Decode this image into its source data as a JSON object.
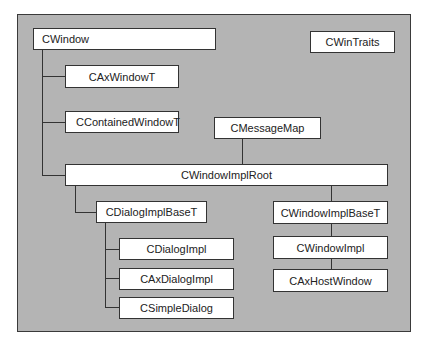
{
  "diagram": {
    "nodes": {
      "cwindow": "CWindow",
      "cwintraits": "CWinTraits",
      "caxwindowt": "CAxWindowT",
      "ccontainedwindowt": "CContainedWindowT",
      "cmessagemap": "CMessageMap",
      "cwindowimplroot": "CWindowImplRoot",
      "cdialogimplbaset": "CDialogImplBaseT",
      "cdialogimpl": "CDialogImpl",
      "caxdialogimpl": "CAxDialogImpl",
      "csimpledialog": "CSimpleDialog",
      "cwindowimplbaset": "CWindowImplBaseT",
      "cwindowimpl": "CWindowImpl",
      "caxhostwindow": "CAxHostWindow"
    },
    "colors": {
      "background": "#b4b4b4",
      "box_fill": "#ffffff",
      "line": "#333333"
    }
  }
}
